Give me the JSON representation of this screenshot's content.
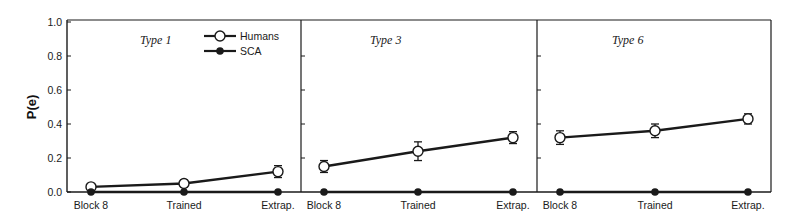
{
  "chart_data": {
    "type": "line",
    "ylabel": "P(e)",
    "ylim": [
      0,
      1.0
    ],
    "yticks": [
      "0.0",
      "0.2",
      "0.4",
      "0.6",
      "0.8",
      "1.0"
    ],
    "categories": [
      "Block 8",
      "Trained",
      "Extrap."
    ],
    "legend": {
      "position": "upper-right of first panel",
      "entries": [
        {
          "name": "Humans",
          "marker": "open-circle"
        },
        {
          "name": "SCA",
          "marker": "filled-circle"
        }
      ]
    },
    "panels": [
      {
        "title": "Type 1",
        "series": [
          {
            "name": "Humans",
            "values": [
              0.03,
              0.05,
              0.12
            ],
            "errors": [
              0.015,
              0.02,
              0.035
            ]
          },
          {
            "name": "SCA",
            "values": [
              0.0,
              0.0,
              0.0
            ],
            "errors": [
              0,
              0,
              0
            ]
          }
        ]
      },
      {
        "title": "Type 3",
        "series": [
          {
            "name": "Humans",
            "values": [
              0.15,
              0.24,
              0.32
            ],
            "errors": [
              0.035,
              0.055,
              0.035
            ]
          },
          {
            "name": "SCA",
            "values": [
              0.0,
              0.0,
              0.0
            ],
            "errors": [
              0,
              0,
              0
            ]
          }
        ]
      },
      {
        "title": "Type 6",
        "series": [
          {
            "name": "Humans",
            "values": [
              0.32,
              0.36,
              0.43
            ],
            "errors": [
              0.04,
              0.04,
              0.03
            ]
          },
          {
            "name": "SCA",
            "values": [
              0.0,
              0.0,
              0.0
            ],
            "errors": [
              0,
              0,
              0
            ]
          }
        ]
      }
    ],
    "grid": false
  }
}
